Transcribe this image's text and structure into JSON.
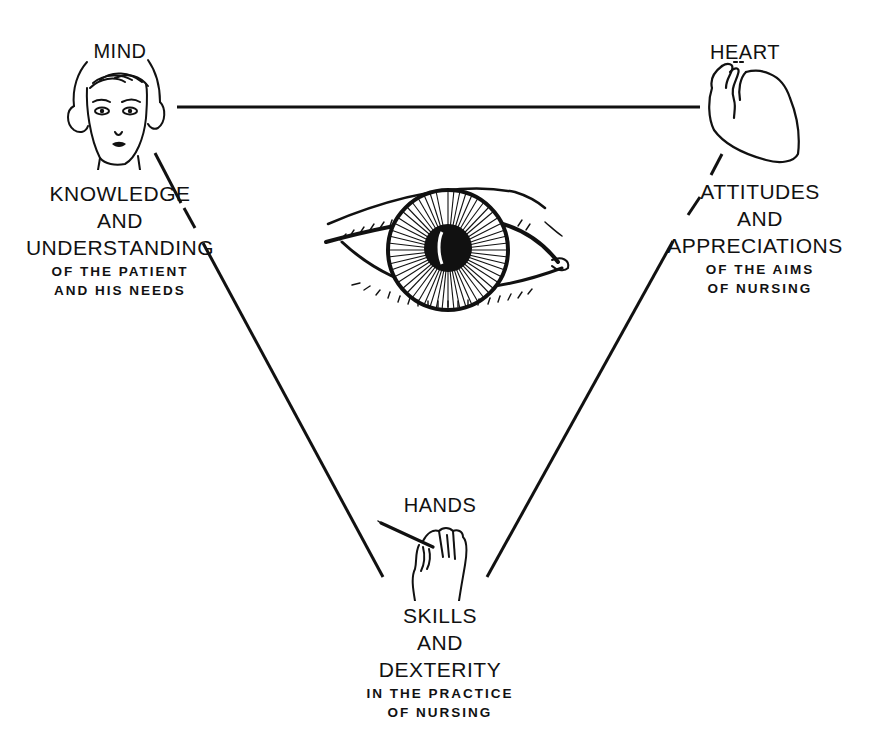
{
  "diagram": {
    "mind": {
      "title": "MIND",
      "line1": "KNOWLEDGE",
      "line2": "AND",
      "line3": "UNDERSTANDING",
      "sub1": "OF THE PATIENT",
      "sub2": "AND HIS NEEDS",
      "icon": "woman-face-icon"
    },
    "heart": {
      "title": "HEART",
      "line1": "ATTITUDES",
      "line2": "AND",
      "line3": "APPRECIATIONS",
      "sub1": "OF THE AIMS",
      "sub2": "OF NURSING",
      "icon": "heart-organ-icon"
    },
    "hands": {
      "title": "HANDS",
      "line1": "SKILLS",
      "line2": "AND",
      "line3": "DEXTERITY",
      "sub1": "IN THE PRACTICE",
      "sub2": "OF NURSING",
      "icon": "hand-holding-instrument-icon"
    },
    "center": {
      "icon": "eye-icon"
    },
    "colors": {
      "ink": "#111111",
      "background": "#ffffff"
    }
  }
}
